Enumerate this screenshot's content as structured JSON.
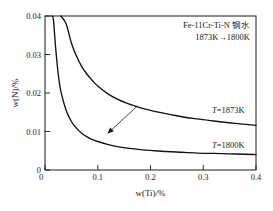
{
  "chart_data": {
    "type": "line",
    "title": "",
    "xlabel": "w(Ti)/%",
    "ylabel": "w(N)/%",
    "xlim": [
      0,
      0.4
    ],
    "ylim": [
      0,
      0.04
    ],
    "xticks": [
      "0",
      "0.1",
      "0.2",
      "0.3",
      "0.4"
    ],
    "xtick_values": [
      0,
      0.1,
      0.2,
      0.3,
      0.4
    ],
    "yticks": [
      "0",
      "0.01",
      "0.02",
      "0.03",
      "0.04"
    ],
    "ytick_values": [
      0,
      0.01,
      0.02,
      0.03,
      0.04
    ],
    "grid": false,
    "legend_position": "inline-right-of-curves",
    "series": [
      {
        "name": "T=1873K",
        "label_prefix": "T",
        "label_suffix": "=1873K",
        "asymptote_y": 0.011,
        "x": [
          0.017,
          0.02,
          0.025,
          0.03,
          0.04,
          0.05,
          0.06,
          0.07,
          0.08,
          0.09,
          0.1,
          0.12,
          0.14,
          0.16,
          0.18,
          0.2,
          0.22,
          0.25,
          0.28,
          0.31,
          0.34,
          0.37,
          0.4
        ],
        "y": [
          0.04,
          0.04,
          0.04,
          0.04,
          0.038,
          0.033,
          0.0295,
          0.0268,
          0.0248,
          0.0232,
          0.0218,
          0.0197,
          0.0182,
          0.0171,
          0.0162,
          0.0155,
          0.0149,
          0.0141,
          0.0134,
          0.0129,
          0.0124,
          0.012,
          0.0116
        ]
      },
      {
        "name": "T=1800K",
        "label_prefix": "T",
        "label_suffix": "=1800K",
        "asymptote_y": 0.004,
        "x": [
          0.008,
          0.01,
          0.013,
          0.016,
          0.02,
          0.025,
          0.03,
          0.04,
          0.05,
          0.06,
          0.07,
          0.08,
          0.09,
          0.1,
          0.12,
          0.14,
          0.16,
          0.18,
          0.2,
          0.23,
          0.26,
          0.29,
          0.32,
          0.35,
          0.38,
          0.4
        ],
        "y": [
          0.04,
          0.04,
          0.04,
          0.039,
          0.032,
          0.025,
          0.0205,
          0.0155,
          0.0126,
          0.0108,
          0.0095,
          0.0086,
          0.0079,
          0.0074,
          0.0066,
          0.006,
          0.0056,
          0.0053,
          0.0051,
          0.0048,
          0.0046,
          0.0044,
          0.0043,
          0.0042,
          0.0041,
          0.004
        ]
      }
    ],
    "annotations": [
      {
        "text": "Fe-11Cr-Ti-N 钢水"
      },
      {
        "text": "1873K→1800K"
      }
    ],
    "arrow": {
      "from_x": 0.175,
      "from_y": 0.0166,
      "to_x": 0.118,
      "to_y": 0.0094
    }
  }
}
